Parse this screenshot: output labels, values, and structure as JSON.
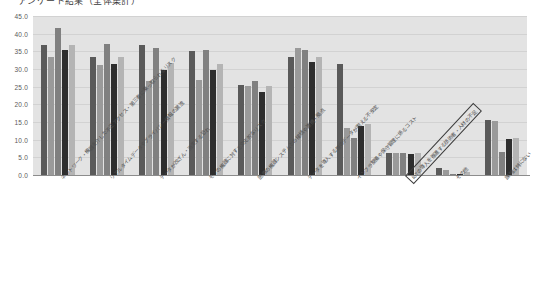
{
  "title": "アンケート結果（全体集計）",
  "chart_data": {
    "type": "bar",
    "title": "アンケート結果（全体集計）",
    "xlabel": "",
    "ylabel": "",
    "ylim": [
      0.0,
      45.0
    ],
    "ytick_step": 5.0,
    "yticks": [
      "45.0",
      "40.0",
      "35.0",
      "30.0",
      "25.0",
      "20.0",
      "15.0",
      "10.0",
      "5.0",
      "0.0"
    ],
    "grid": true,
    "legend": "none",
    "orientation": "vertical",
    "group_count": 10,
    "series_count": 5,
    "series_colors": [
      "#5a5a5a",
      "#9a9a9a",
      "#808080",
      "#2e2e2e",
      "#b4b4b4"
    ],
    "categories": [
      "ネットワーク・機器を介した不正アクセス・第三者に乗っ取られるリスク",
      "リアルタイムデータやプライバシー情報の漏洩",
      "データが改ざん・消失する恐れ",
      "モノの機器に対する文化的なリスク",
      "医療の機器システムとの接続や連携・拠点",
      "データを導入する際のデータが抱える不安定",
      "インフラ整備や保守管理に係るコスト",
      "IoTの導入を推進する技術者・人材の不足",
      "その他",
      "課題は特にない"
    ],
    "series": [
      {
        "name": "系列1",
        "values": [
          36.8,
          33.3,
          36.7,
          35.2,
          25.6,
          33.3,
          31.5,
          6.3,
          2.0,
          15.6
        ]
      },
      {
        "name": "系列2",
        "values": [
          33.5,
          31.2,
          26.7,
          27.0,
          25.3,
          36.0,
          13.2,
          6.2,
          1.4,
          15.2
        ]
      },
      {
        "name": "系列3",
        "values": [
          41.7,
          37.2,
          36.0,
          35.3,
          26.7,
          35.3,
          10.6,
          6.1,
          0.4,
          6.6
        ]
      },
      {
        "name": "系列4",
        "values": [
          35.3,
          31.5,
          29.6,
          29.8,
          23.5,
          32.0,
          14.0,
          6.0,
          0.3,
          10.2
        ]
      },
      {
        "name": "系列5",
        "values": [
          36.8,
          33.4,
          31.8,
          31.5,
          25.2,
          33.5,
          14.5,
          6.2,
          0.8,
          10.5
        ]
      }
    ],
    "highlighted_category": "IoTの導入を推進する技術者・人材の不足"
  }
}
